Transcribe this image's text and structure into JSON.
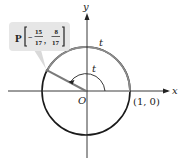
{
  "diagram": {
    "axes": {
      "x_label": "x",
      "y_label": "y",
      "origin_label": "O"
    },
    "point_one_zero_label": "(1, 0)",
    "arc_label_outer": "t",
    "arc_label_inner": "t",
    "point": {
      "name": "P",
      "x_num": "15",
      "x_den": "17",
      "x_sign": "−",
      "y_num": "8",
      "y_den": "17",
      "comma": ","
    },
    "colors": {
      "axis": "#222222",
      "circle": "#1a1a1a",
      "arc_highlight": "#8c8c8c",
      "label_box": "#e6e6e6"
    }
  }
}
